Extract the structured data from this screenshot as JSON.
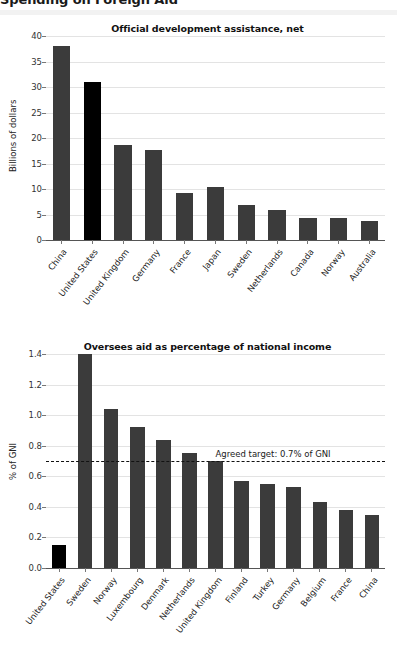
{
  "page": {
    "header_title": "Spending on Foreign Aid"
  },
  "chart_data": [
    {
      "id": "official-development-assistance",
      "type": "bar",
      "title": "Official development assistance, net",
      "xlabel": "",
      "ylabel": "Billions of dollars",
      "ylim": [
        0,
        40
      ],
      "yticks": [
        0,
        5,
        10,
        15,
        20,
        25,
        30,
        35,
        40
      ],
      "ytick_labels": [
        "0",
        "5",
        "10",
        "15",
        "20",
        "25",
        "30",
        "35",
        "40"
      ],
      "grid": true,
      "legend": "none",
      "categories": [
        "China",
        "United States",
        "United Kingdom",
        "Germany",
        "France",
        "Japan",
        "Sweden",
        "Netherlands",
        "Canada",
        "Norway",
        "Australia"
      ],
      "values": [
        38.0,
        31.0,
        18.7,
        17.7,
        9.2,
        10.3,
        6.9,
        5.8,
        4.3,
        4.3,
        3.8
      ],
      "highlight_index": 1,
      "bar_color": "#3b3b3b",
      "highlight_color": "#000000"
    },
    {
      "id": "oversees-aid-percentage",
      "type": "bar",
      "title": "Oversees aid as percentage of national income",
      "xlabel": "",
      "ylabel": "% of GNI",
      "ylim": [
        0,
        1.4
      ],
      "yticks": [
        0.0,
        0.2,
        0.4,
        0.6,
        0.8,
        1.0,
        1.2,
        1.4
      ],
      "ytick_labels": [
        "0.0",
        "0.2",
        "0.4",
        "0.6",
        "0.8",
        "1.0",
        "1.2",
        "1.4"
      ],
      "grid": true,
      "legend": "none",
      "categories": [
        "United States",
        "Sweden",
        "Norway",
        "Luxembourg",
        "Denmark",
        "Netherlands",
        "United Kingdom",
        "Finland",
        "Turkey",
        "Germany",
        "Belgium",
        "France",
        "China"
      ],
      "values": [
        0.15,
        1.4,
        1.04,
        0.92,
        0.84,
        0.75,
        0.7,
        0.57,
        0.55,
        0.53,
        0.43,
        0.38,
        0.35
      ],
      "highlight_index": 0,
      "bar_color": "#3b3b3b",
      "highlight_color": "#000000",
      "annotations": [
        {
          "kind": "hline",
          "value": 0.7,
          "label": "Agreed target: 0.7% of GNI",
          "style": "dashed",
          "color": "#111111",
          "label_x_fraction": 0.5
        }
      ]
    }
  ]
}
